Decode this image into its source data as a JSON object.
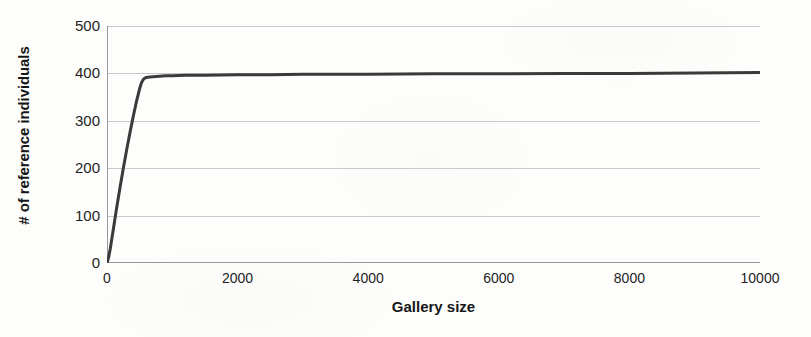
{
  "chart_data": {
    "type": "line",
    "title": "",
    "xlabel": "Gallery size",
    "ylabel": "# of reference individuals",
    "xlim": [
      0,
      10000
    ],
    "ylim": [
      0,
      500
    ],
    "xticks": [
      0,
      2000,
      4000,
      6000,
      8000,
      10000
    ],
    "yticks": [
      0,
      100,
      200,
      300,
      400,
      500
    ],
    "xtick_labels": [
      "0",
      "2000",
      "4000",
      "6000",
      "8000",
      "10000"
    ],
    "ytick_labels": [
      "0",
      "100",
      "200",
      "300",
      "400",
      "500"
    ],
    "grid": "horizontal",
    "legend": "none",
    "line_color": "#3a3a3a",
    "line_width": 3,
    "series": [
      {
        "name": "# of reference individuals",
        "x": [
          0,
          25,
          50,
          75,
          100,
          150,
          200,
          250,
          300,
          350,
          400,
          450,
          500,
          530,
          560,
          590,
          620,
          700,
          800,
          900,
          1000,
          1200,
          1500,
          2000,
          2500,
          3000,
          4000,
          5000,
          6000,
          7000,
          8000,
          9000,
          10000
        ],
        "y": [
          0,
          12,
          30,
          52,
          74,
          118,
          160,
          200,
          238,
          274,
          308,
          340,
          368,
          381,
          388,
          391,
          392,
          393,
          394,
          395,
          395,
          396,
          396,
          397,
          397,
          398,
          398,
          399,
          399,
          400,
          400,
          401,
          402
        ]
      }
    ]
  },
  "axis": {
    "ylabel_text": "# of reference individuals",
    "xlabel_text": "Gallery size"
  }
}
